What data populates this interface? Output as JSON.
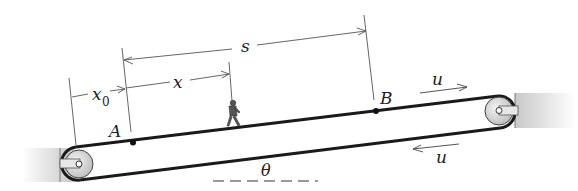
{
  "diagram": {
    "labels": {
      "x0": "x",
      "x0_sub": "0",
      "x": "x",
      "s": "s",
      "A": "A",
      "B": "B",
      "u_top": "u",
      "u_bottom": "u",
      "theta": "θ"
    },
    "colors": {
      "belt": "#1a1a1a",
      "dimension_line": "#555555",
      "support": "#cfcfcf",
      "pulley": "#d9d9d9"
    }
  }
}
